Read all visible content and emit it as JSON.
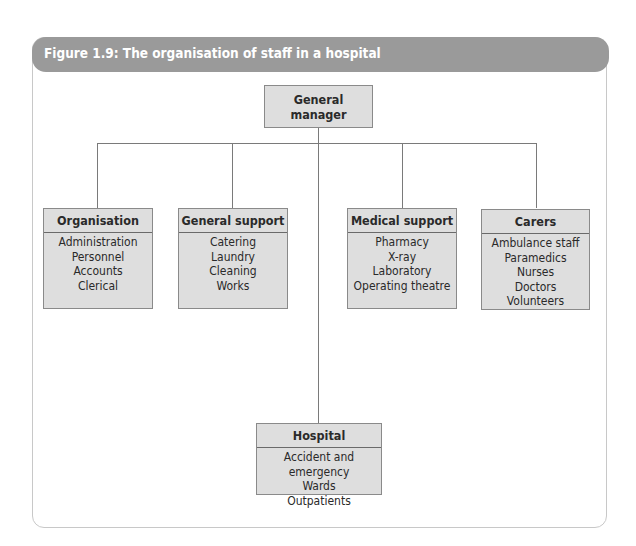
{
  "figure": {
    "title": "Figure 1.9: The organisation of staff in a hospital"
  },
  "root": {
    "label": "General manager"
  },
  "departments": [
    {
      "title": "Organisation",
      "items": [
        "Administration",
        "Personnel",
        "Accounts",
        "Clerical"
      ]
    },
    {
      "title": "General support",
      "items": [
        "Catering",
        "Laundry",
        "Cleaning",
        "Works"
      ]
    },
    {
      "title": "Medical support",
      "items": [
        "Pharmacy",
        "X-ray",
        "Laboratory",
        "Operating theatre"
      ]
    },
    {
      "title": "Carers",
      "items": [
        "Ambulance staff",
        "Paramedics",
        "Nurses",
        "Doctors",
        "Volunteers"
      ]
    },
    {
      "title": "Hospital",
      "items": [
        "Accident and emergency",
        "Wards",
        "Outpatients"
      ]
    }
  ],
  "colors": {
    "header": "#9a9a9a",
    "box_fill": "#dedede",
    "lines": "#7a7a7a"
  }
}
